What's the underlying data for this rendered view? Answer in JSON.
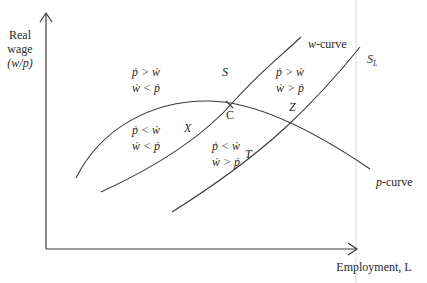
{
  "diagram": {
    "y_axis": {
      "label_lines": [
        "Real",
        "wage",
        "(w/p)"
      ]
    },
    "x_axis": {
      "label": "Employment, L"
    },
    "curves": [
      {
        "id": "w-curve",
        "label": "w-curve"
      },
      {
        "id": "p-curve",
        "label": "p-curve"
      },
      {
        "id": "S_L",
        "label": "S",
        "subscript": "L"
      }
    ],
    "points": [
      {
        "id": "S",
        "label": "S"
      },
      {
        "id": "C",
        "label": "C"
      },
      {
        "id": "X",
        "label": "X"
      },
      {
        "id": "Z",
        "label": "Z"
      },
      {
        "id": "T",
        "label": "T"
      }
    ],
    "regions": {
      "top_left": [
        "ṗ > ẇ",
        "ẇ < ṗ"
      ],
      "top_right": [
        "ṗ > ẇ",
        "ẇ > ṗ"
      ],
      "bottom_left": [
        "ṗ < ẇ",
        "ẇ < ṗ"
      ],
      "bottom_right": [
        "ṗ < ẇ",
        "ẇ > ṗ"
      ]
    }
  }
}
